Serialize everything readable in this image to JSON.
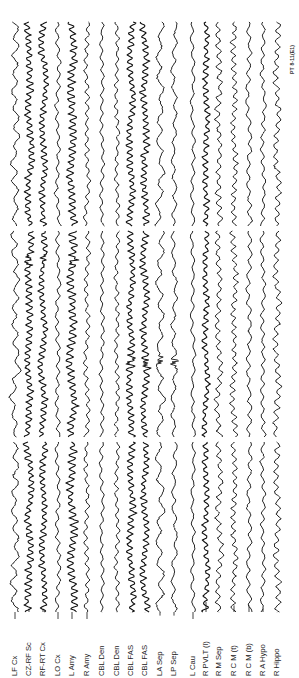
{
  "chart_data": {
    "type": "line",
    "title": "",
    "orientation": "rotated-90-ccw",
    "panels": 3,
    "annotation": "PT 8-11(E1)",
    "xlabel": "",
    "ylabel": "",
    "grid": false,
    "legend": "channel labels at trace start",
    "channels": [
      {
        "label": "LF Cx",
        "x": 15,
        "amp": 3.0,
        "freq": 0.35
      },
      {
        "label": "CZ-RF Sc",
        "x": 29,
        "amp": 3.2,
        "freq": 0.9
      },
      {
        "label": "RF-RT Cx",
        "x": 43,
        "amp": 2.8,
        "freq": 0.9
      },
      {
        "label": "LO Cx",
        "x": 58,
        "amp": 1.8,
        "freq": 0.5
      },
      {
        "label": "L Amy",
        "x": 72,
        "amp": 3.6,
        "freq": 0.9
      },
      {
        "label": "R Amy",
        "x": 87,
        "amp": 2.0,
        "freq": 0.6
      },
      {
        "label": "CBL Den",
        "x": 102,
        "amp": 1.6,
        "freq": 0.5
      },
      {
        "label": "CBL Den",
        "x": 117,
        "amp": 1.8,
        "freq": 0.6
      },
      {
        "label": "CBL FAS",
        "x": 131,
        "amp": 3.0,
        "freq": 0.9
      },
      {
        "label": "CBL FAS",
        "x": 145,
        "amp": 3.0,
        "freq": 0.9
      },
      {
        "label": "LA Sep",
        "x": 160,
        "amp": 3.0,
        "freq": 0.3
      },
      {
        "label": "LP Sep",
        "x": 174,
        "amp": 2.2,
        "freq": 0.35
      },
      {
        "label": "L Cau",
        "x": 193,
        "amp": 1.6,
        "freq": 0.4
      },
      {
        "label": "R PVLT (l)",
        "x": 206,
        "amp": 2.6,
        "freq": 0.8
      },
      {
        "label": "R M Sep",
        "x": 219,
        "amp": 2.6,
        "freq": 0.6
      },
      {
        "label": "R C M (t)",
        "x": 234,
        "amp": 2.4,
        "freq": 0.7
      },
      {
        "label": "R C M (b)",
        "x": 249,
        "amp": 2.0,
        "freq": 0.45
      },
      {
        "label": "R A Hypo",
        "x": 263,
        "amp": 1.8,
        "freq": 0.5
      },
      {
        "label": "R Hippo",
        "x": 277,
        "amp": 2.6,
        "freq": 0.6
      }
    ],
    "panel_ranges_px": [
      [
        22,
        226
      ],
      [
        231,
        437
      ],
      [
        442,
        612
      ]
    ],
    "events": [
      {
        "panel": 2,
        "channels": [
          "CZ-RF Sc",
          "RF-RT Cx",
          "L Amy"
        ],
        "description": "high-amplitude spike burst",
        "y_px": 260
      },
      {
        "panel": 2,
        "channels": [
          "CBL FAS",
          "LA Sep",
          "LP Sep"
        ],
        "description": "large transient deflection",
        "y_px": 362
      }
    ],
    "trace_color": "#111111",
    "background": "#ffffff"
  },
  "labels": {
    "ch0": "LF Cx",
    "ch1": "CZ-RF Sc",
    "ch2": "RF-RT Cx",
    "ch3": "LO Cx",
    "ch4": "L Amy",
    "ch5": "R Amy",
    "ch6": "CBL Den",
    "ch7": "CBL Den",
    "ch8": "CBL FAS",
    "ch9": "CBL FAS",
    "ch10": "LA Sep",
    "ch11": "LP Sep",
    "ch12": "L Cau",
    "ch13": "R PVLT (l)",
    "ch14": "R M Sep",
    "ch15": "R C M (t)",
    "ch16": "R C M (b)",
    "ch17": "R A Hypo",
    "ch18": "R Hippo"
  },
  "annotation": "PT 8-11(E1)"
}
